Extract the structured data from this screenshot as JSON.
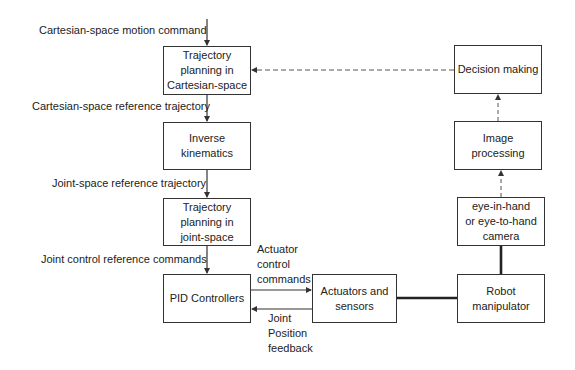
{
  "diagram": {
    "boxes": {
      "traj_cartesian": "Trajectory\nplanning in\nCartesian-space",
      "inverse_kinematics": "Inverse\nkinematics",
      "traj_joint": "Trajectory\nplanning in\njoint-space",
      "pid": "PID Controllers",
      "actuators": "Actuators and\nsensors",
      "robot": "Robot\nmanipulator",
      "camera": "eye-in-hand\nor eye-to-hand\ncamera",
      "image_processing": "Image\nprocessing",
      "decision": "Decision making"
    },
    "labels": {
      "cartesian_motion_command": "Cartesian-space motion command",
      "cartesian_reference_trajectory": "Cartesian-space reference trajectory",
      "joint_reference_trajectory": "Joint-space reference trajectory",
      "joint_control_reference": "Joint control reference commands",
      "actuator_control_commands": "Actuator\ncontrol\ncommands",
      "joint_position_feedback": "Joint\nPosition\nfeedback"
    },
    "colors": {
      "line": "#333333",
      "box_border": "#333333",
      "background": "#ffffff"
    }
  }
}
